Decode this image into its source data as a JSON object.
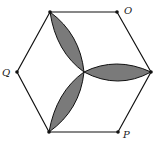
{
  "figure": {
    "type": "geometry-diagram",
    "shape": "regular hexagon with three shaded lens (petal) regions meeting at center",
    "labels": {
      "O": "O",
      "P": "P",
      "Q": "Q"
    },
    "vertices": {
      "top_left": [
        50,
        12
      ],
      "top_right": [
        117,
        12
      ],
      "right": [
        151,
        72
      ],
      "bottom_right": [
        118,
        132
      ],
      "bottom_left": [
        49,
        132
      ],
      "left": [
        17,
        72
      ]
    },
    "center": [
      84,
      72
    ],
    "colors": {
      "stroke": "#111111",
      "shade": "#7a7a7a",
      "background": "#ffffff"
    }
  }
}
